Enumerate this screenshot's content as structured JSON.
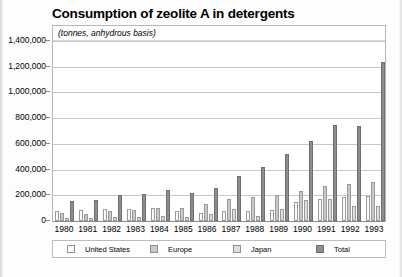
{
  "chart_data": {
    "type": "bar",
    "title": "Consumption of zeolite A in detergents",
    "subtitle": "(tonnes, anhydrous basis)",
    "xlabel": "",
    "ylabel": "",
    "ylim": [
      0,
      1400000
    ],
    "ytick_step": 200000,
    "grid": true,
    "legend_position": "bottom",
    "categories": [
      "1980",
      "1981",
      "1982",
      "1983",
      "1984",
      "1985",
      "1986",
      "1987",
      "1988",
      "1989",
      "1990",
      "1991",
      "1992",
      "1993"
    ],
    "ytick_labels": [
      "0",
      "200,000",
      "400,000",
      "600,000",
      "800,000",
      "1,000,000",
      "1,200,000",
      "1,400,000"
    ],
    "series": [
      {
        "name": "United States",
        "color": "#fcfcfc",
        "values": [
          75000,
          85000,
          95000,
          90000,
          100000,
          75000,
          65000,
          75000,
          75000,
          85000,
          145000,
          175000,
          190000,
          195000
        ]
      },
      {
        "name": "Europe",
        "color": "#c9c9c9",
        "values": [
          60000,
          55000,
          75000,
          85000,
          100000,
          105000,
          135000,
          170000,
          185000,
          205000,
          235000,
          270000,
          290000,
          300000
        ]
      },
      {
        "name": "Japan",
        "color": "#dedede",
        "values": [
          20000,
          25000,
          30000,
          35000,
          40000,
          35000,
          55000,
          90000,
          40000,
          95000,
          160000,
          175000,
          115000,
          120000
        ]
      },
      {
        "name": "Total",
        "color": "#8e8e8e",
        "values": [
          155000,
          165000,
          200000,
          210000,
          240000,
          215000,
          255000,
          350000,
          420000,
          520000,
          620000,
          745000,
          740000,
          1240000
        ]
      }
    ]
  },
  "legend": {
    "items": [
      {
        "label": "United States",
        "swatch": "legend-swatch-united-states"
      },
      {
        "label": "Europe",
        "swatch": "legend-swatch-europe"
      },
      {
        "label": "Japan",
        "swatch": "legend-swatch-japan"
      },
      {
        "label": "Total",
        "swatch": "legend-swatch-total"
      }
    ]
  }
}
